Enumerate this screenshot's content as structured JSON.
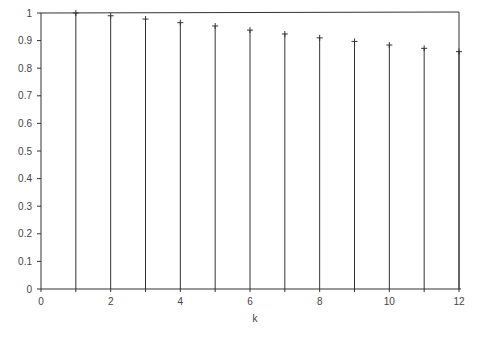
{
  "chart_data": {
    "type": "stem",
    "title": "",
    "xlabel": "k",
    "ylabel": "",
    "xlim": [
      0,
      12
    ],
    "ylim": [
      0,
      1
    ],
    "grid": false,
    "legend": null,
    "x_ticks": [
      "0",
      "2",
      "4",
      "6",
      "8",
      "10",
      "12"
    ],
    "y_ticks": [
      "0",
      "0.1",
      "0.2",
      "0.3",
      "0.4",
      "0.5",
      "0.6",
      "0.7",
      "0.8",
      "0.9",
      "1"
    ],
    "x": [
      1,
      2,
      3,
      4,
      5,
      6,
      7,
      8,
      9,
      10,
      11,
      12
    ],
    "values": [
      1.0,
      0.99,
      0.978,
      0.965,
      0.953,
      0.938,
      0.924,
      0.91,
      0.897,
      0.884,
      0.872,
      0.86
    ],
    "marker": "+",
    "line_color": "#333333"
  }
}
